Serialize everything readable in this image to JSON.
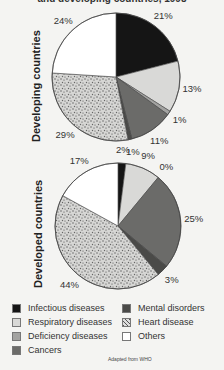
{
  "title": "and developing countries, 1998",
  "credit": "Adapted from WHO",
  "legend": [
    {
      "label": "Infectious diseases",
      "color": "#151515",
      "pattern": "solid"
    },
    {
      "label": "Respiratory diseases",
      "color": "#d9d9d7",
      "pattern": "solid"
    },
    {
      "label": "Deficiency diseases",
      "color": "#a3a3a1",
      "pattern": "solid"
    },
    {
      "label": "Cancers",
      "color": "#6b6b69",
      "pattern": "solid"
    },
    {
      "label": "Mental disorders",
      "color": "#4a4a48",
      "pattern": "solid"
    },
    {
      "label": "Heart disease",
      "color": "#cfcfcd",
      "pattern": "speckle"
    },
    {
      "label": "Others",
      "color": "#ffffff",
      "pattern": "solid"
    }
  ],
  "chart_data": [
    {
      "type": "pie",
      "title": "Developing countries",
      "categories": [
        "Infectious diseases",
        "Respiratory diseases",
        "Deficiency diseases",
        "Cancers",
        "Mental disorders",
        "Heart disease",
        "Others"
      ],
      "values": [
        21,
        13,
        1,
        11,
        1,
        29,
        24
      ],
      "labels": [
        "21%",
        "13%",
        "1%",
        "11%",
        "1%",
        "29%",
        "24%"
      ],
      "start_angle": "12 o'clock, clockwise"
    },
    {
      "type": "pie",
      "title": "Developed countries",
      "categories": [
        "Infectious diseases",
        "Respiratory diseases",
        "Deficiency diseases",
        "Cancers",
        "Mental disorders",
        "Heart disease",
        "Others"
      ],
      "values": [
        2,
        9,
        0,
        25,
        3,
        44,
        17
      ],
      "labels": [
        "2%",
        "9%",
        "0%",
        "25%",
        "3%",
        "44%",
        "17%"
      ],
      "start_angle": "12 o'clock, clockwise"
    }
  ],
  "pies": [
    {
      "ylabel": "Developing countries",
      "cx": 116,
      "cy": 77,
      "r": 64
    },
    {
      "ylabel": "Developed countries",
      "cx": 118,
      "cy": 226,
      "r": 63
    }
  ]
}
